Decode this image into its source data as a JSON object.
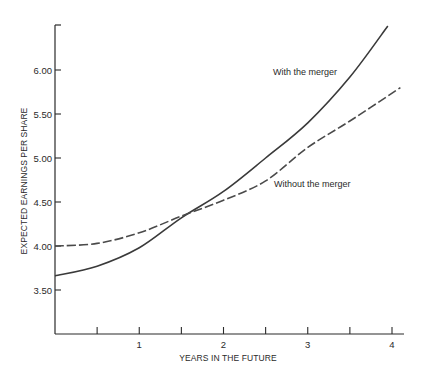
{
  "chart_data": {
    "type": "line",
    "title": "",
    "xlabel": "YEARS IN THE FUTURE",
    "ylabel": "EXPECTED EARNINGS PER SHARE",
    "xlim": [
      0,
      4.15
    ],
    "ylim": [
      3.0,
      6.6
    ],
    "grid": false,
    "legend": "inline labels",
    "x_ticks": [
      {
        "value": 0.5,
        "label": ""
      },
      {
        "value": 1,
        "label": "1"
      },
      {
        "value": 1.5,
        "label": ""
      },
      {
        "value": 2,
        "label": "2"
      },
      {
        "value": 2.5,
        "label": ""
      },
      {
        "value": 3,
        "label": "3"
      },
      {
        "value": 3.5,
        "label": ""
      },
      {
        "value": 4,
        "label": "4"
      }
    ],
    "y_ticks": [
      {
        "value": 3.5,
        "label": "3.50"
      },
      {
        "value": 4.0,
        "label": "4.00"
      },
      {
        "value": 4.5,
        "label": "4.50"
      },
      {
        "value": 5.0,
        "label": "5.00"
      },
      {
        "value": 5.5,
        "label": "5.50"
      },
      {
        "value": 6.0,
        "label": "6.00"
      }
    ],
    "series": [
      {
        "name": "With the merger",
        "style": "solid",
        "color": "#3a3a3a",
        "x": [
          0,
          0.5,
          1,
          1.5,
          2,
          2.5,
          3,
          3.5,
          3.95
        ],
        "values": [
          3.66,
          3.77,
          3.98,
          4.32,
          4.62,
          5.0,
          5.4,
          5.92,
          6.5
        ],
        "label_pos": {
          "x": 273,
          "y": 75
        }
      },
      {
        "name": "Without the merger",
        "style": "dashed",
        "color": "#4a4a4a",
        "x": [
          0,
          0.5,
          1,
          1.5,
          2,
          2.5,
          3,
          3.5,
          4.1
        ],
        "values": [
          4.0,
          4.03,
          4.15,
          4.34,
          4.52,
          4.74,
          5.12,
          5.42,
          5.8
        ],
        "label_pos": {
          "x": 274,
          "y": 187
        }
      }
    ],
    "annotations": [
      {
        "text": "With the merger",
        "near": "solid line, upper right"
      },
      {
        "text": "Without the merger",
        "near": "dashed line, right"
      }
    ]
  },
  "axes": {
    "x_title": "YEARS IN THE FUTURE",
    "y_title": "EXPECTED EARNINGS PER SHARE"
  },
  "colors": {
    "axis": "#2a2a2a",
    "text": "#2a2a2a",
    "background": "#ffffff"
  }
}
